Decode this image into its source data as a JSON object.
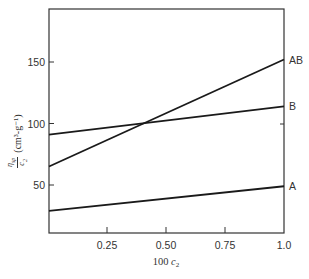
{
  "chart_data": {
    "type": "line",
    "title": "",
    "xlabel": "100 c2",
    "ylabel": "η_sp / c2 (cm3-g-1)",
    "ylabel_parts": {
      "numerator": "η_sp",
      "denominator": "c_2",
      "units": "(cm³-g⁻¹)"
    },
    "xlim": [
      0,
      1.0
    ],
    "ylim": [
      10,
      195
    ],
    "x_ticks": [
      0.25,
      0.5,
      0.75,
      1.0
    ],
    "x_tick_labels": [
      "0.25",
      "0.50",
      "0.75",
      "1.0"
    ],
    "y_ticks": [
      50,
      100,
      150
    ],
    "y_tick_labels": [
      "50",
      "100",
      "150"
    ],
    "grid": false,
    "legend": "inline labels at right end of lines",
    "x": [
      0,
      1.0
    ],
    "series": [
      {
        "name": "AB",
        "values": [
          65,
          152
        ]
      },
      {
        "name": "B",
        "values": [
          91,
          114
        ]
      },
      {
        "name": "A",
        "values": [
          29,
          49
        ]
      }
    ]
  },
  "labels": {
    "xlabel_prefix": "100 ",
    "xlabel_var": "c",
    "xlabel_sub": "2",
    "y_num": "η",
    "y_num_sub": "sp",
    "y_den": "c",
    "y_den_sub": "2",
    "y_units": "(cm³-g⁻¹)"
  }
}
